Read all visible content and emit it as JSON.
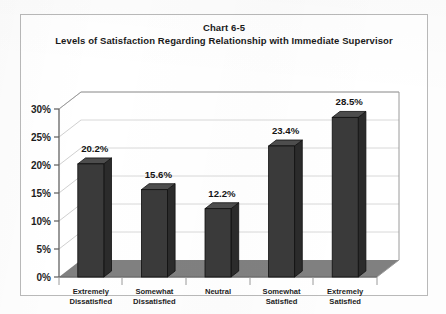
{
  "chart_data": {
    "type": "bar",
    "title": "Chart 6-5",
    "subtitle": "Levels of Satisfaction Regarding Relationship with Immediate Supervisor",
    "categories": [
      "Extremely Dissatisfied",
      "Somewhat Dissatisfied",
      "Neutral",
      "Somewhat Satisfied",
      "Extremely Satisfied"
    ],
    "category_lines": [
      [
        "Extremely",
        "Dissatisfied"
      ],
      [
        "Somewhat",
        "Dissatisfied"
      ],
      [
        "Neutral",
        ""
      ],
      [
        "Somewhat",
        "Satisfied"
      ],
      [
        "Extremely",
        "Satisfied"
      ]
    ],
    "values": [
      20.2,
      15.6,
      12.2,
      23.4,
      28.5
    ],
    "data_labels": [
      "20.2%",
      "15.6%",
      "12.2%",
      "23.4%",
      "28.5%"
    ],
    "xlabel": "",
    "ylabel": "",
    "ylim": [
      0,
      30
    ],
    "ytick_values": [
      0,
      5,
      10,
      15,
      20,
      25,
      30
    ],
    "ytick_labels": [
      "0%",
      "5%",
      "10%",
      "15%",
      "20%",
      "25%",
      "30%"
    ],
    "grid": true,
    "legend": false,
    "style": "3d-column",
    "colors": {
      "bar_front": "#3a3a3a",
      "bar_top": "#4d4d4d",
      "bar_side": "#2b2b2b",
      "floor": "#808080",
      "wall": "#ffffff",
      "gridline": "#d6d6d6",
      "axis": "#6e6e6e",
      "frame": "#b9b9b9",
      "text": "#1a1a1a"
    }
  }
}
